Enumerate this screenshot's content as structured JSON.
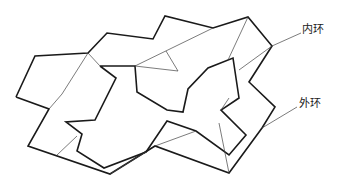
{
  "labels": {
    "inner_ring": "内环",
    "outer_ring": "外环"
  },
  "colors": {
    "stroke": "#1a1a1a",
    "thin_stroke": "#444444",
    "background": "#ffffff"
  },
  "diagram": {
    "callouts": [
      {
        "label": "内环",
        "anchor": [
          272,
          46
        ],
        "text_pos": [
          302,
          26
        ]
      },
      {
        "label": "外环",
        "anchor": [
          262,
          128
        ],
        "text_pos": [
          299,
          100
        ]
      }
    ]
  }
}
